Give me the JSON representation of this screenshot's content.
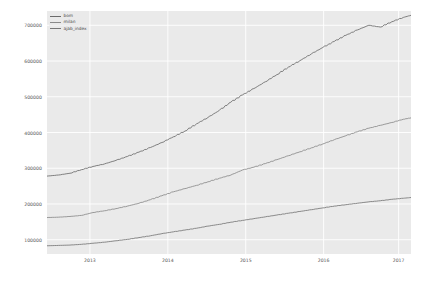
{
  "chart": {
    "title": "",
    "background": "#eaeaea",
    "grid_color": "#ffffff",
    "tick_color": "#555555"
  },
  "legend": {
    "position": "upper-left",
    "entries": [
      {
        "label": "bom",
        "color": "#6b6b6b"
      },
      {
        "label": "milan",
        "color": "#8a8a8a"
      },
      {
        "label": "ajab_index",
        "color": "#777777"
      }
    ]
  },
  "axes": {
    "x": {
      "label": "",
      "ticks": [
        "2013",
        "2014",
        "2015",
        "2016",
        "2017"
      ],
      "tick_positions": [
        0.118,
        0.332,
        0.546,
        0.76,
        0.966
      ],
      "range": [
        "2012-07",
        "2017-04"
      ]
    },
    "y": {
      "label": "",
      "ticks": [
        "700000",
        "600000",
        "500000",
        "400000",
        "300000",
        "200000",
        "100000"
      ],
      "tick_values": [
        700000,
        600000,
        500000,
        400000,
        300000,
        200000,
        100000
      ],
      "range": [
        60000,
        740000
      ]
    }
  },
  "chart_data": {
    "type": "line",
    "title": "",
    "xlabel": "",
    "ylabel": "",
    "xlim": [
      2012.55,
      2017.3
    ],
    "ylim": [
      60000,
      740000
    ],
    "grid": true,
    "legend_position": "upper left",
    "x": [
      2012.55,
      2012.7,
      2012.85,
      2013.0,
      2013.15,
      2013.3,
      2013.45,
      2013.6,
      2013.75,
      2013.9,
      2014.05,
      2014.2,
      2014.35,
      2014.5,
      2014.65,
      2014.8,
      2014.95,
      2015.1,
      2015.25,
      2015.4,
      2015.55,
      2015.7,
      2015.85,
      2016.0,
      2016.15,
      2016.3,
      2016.45,
      2016.6,
      2016.75,
      2016.9,
      2017.05,
      2017.2,
      2017.3
    ],
    "series": [
      {
        "name": "bom",
        "color": "#6b6b6b",
        "values": [
          278000,
          281000,
          286000,
          296000,
          305000,
          312000,
          322000,
          333000,
          345000,
          358000,
          372000,
          388000,
          404000,
          424000,
          442000,
          462000,
          485000,
          505000,
          523000,
          542000,
          562000,
          583000,
          601000,
          620000,
          638000,
          655000,
          672000,
          687000,
          700000,
          695000,
          710000,
          722000,
          728000
        ]
      },
      {
        "name": "milan",
        "color": "#8a8a8a",
        "values": [
          162000,
          163000,
          165000,
          168000,
          176000,
          181000,
          187000,
          194000,
          202000,
          212000,
          223000,
          234000,
          243000,
          252000,
          262000,
          272000,
          281000,
          295000,
          303000,
          313000,
          324000,
          335000,
          346000,
          357000,
          368000,
          380000,
          391000,
          402000,
          412000,
          420000,
          428000,
          437000,
          441000
        ]
      },
      {
        "name": "ajab_index",
        "color": "#777777",
        "values": [
          83000,
          84000,
          85000,
          87000,
          90000,
          93000,
          97000,
          101000,
          106000,
          111000,
          117000,
          122000,
          127000,
          132000,
          138000,
          143000,
          149000,
          154000,
          159000,
          164000,
          169000,
          174000,
          179000,
          184000,
          189000,
          194000,
          198000,
          202000,
          206000,
          209000,
          213000,
          216000,
          218000
        ]
      }
    ]
  }
}
